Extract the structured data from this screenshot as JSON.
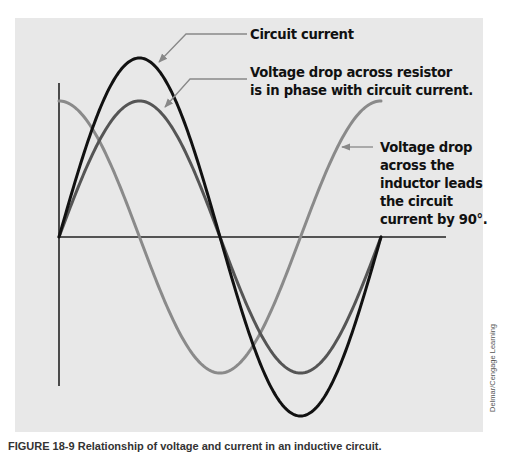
{
  "figure": {
    "labels": {
      "circuit_current": "Circuit current",
      "resistor_line1": "Voltage drop across resistor",
      "resistor_line2": "is in phase with circuit current.",
      "inductor_line1": "Voltage drop",
      "inductor_line2": "across the",
      "inductor_line3": "inductor leads",
      "inductor_line4": "the circuit",
      "inductor_line5": "current by 90°."
    },
    "credit": "Delmar/Cengage Learning",
    "caption": "FIGURE 18-9 Relationship of voltage and current in an inductive circuit.",
    "waveforms": [
      {
        "name": "Circuit current",
        "amplitude": 1.0,
        "phase_deg": 0,
        "color": "#111111"
      },
      {
        "name": "Voltage drop across resistor",
        "amplitude": 0.76,
        "phase_deg": 0,
        "color": "#555555"
      },
      {
        "name": "Voltage drop across inductor",
        "amplitude": 0.76,
        "phase_deg": 90,
        "color": "#8a8a8a"
      }
    ],
    "cycle_deg": 360
  }
}
